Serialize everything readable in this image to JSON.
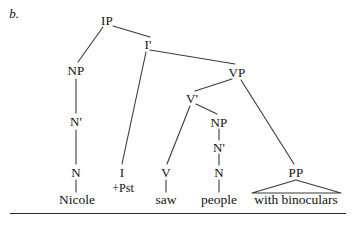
{
  "figure": {
    "item_label": "b.",
    "caption": "",
    "sentence": "Nicole saw people with binoculars"
  },
  "style": {
    "line_color": "#3a3a3a",
    "text_color": "#111111",
    "background": "#ffffff",
    "rule_color": "#2a2a2a"
  },
  "tree": {
    "nodes": [
      {
        "id": "IP",
        "label": "IP",
        "x": 107,
        "y": 20
      },
      {
        "id": "NP1",
        "label": "NP",
        "x": 76,
        "y": 70
      },
      {
        "id": "Nbar1",
        "label": "N'",
        "x": 76,
        "y": 121
      },
      {
        "id": "N1",
        "label": "N",
        "x": 76,
        "y": 172
      },
      {
        "id": "Ibar",
        "label": "I'",
        "x": 148,
        "y": 44
      },
      {
        "id": "I",
        "label": "I",
        "x": 122,
        "y": 172
      },
      {
        "id": "VP",
        "label": "VP",
        "x": 237,
        "y": 72
      },
      {
        "id": "Vbar",
        "label": "V'",
        "x": 192,
        "y": 98
      },
      {
        "id": "V",
        "label": "V",
        "x": 166,
        "y": 172
      },
      {
        "id": "NP2",
        "label": "NP",
        "x": 219,
        "y": 122
      },
      {
        "id": "Nbar2",
        "label": "N'",
        "x": 219,
        "y": 147
      },
      {
        "id": "N2",
        "label": "N",
        "x": 219,
        "y": 172
      },
      {
        "id": "PP",
        "label": "PP",
        "x": 296,
        "y": 172
      }
    ],
    "features": [
      {
        "id": "pst",
        "label": "+Pst",
        "x": 123,
        "y": 188
      }
    ],
    "leaves": [
      {
        "id": "w-nicole",
        "label": "Nicole",
        "x": 77,
        "y": 200
      },
      {
        "id": "w-saw",
        "label": "saw",
        "x": 166,
        "y": 200
      },
      {
        "id": "w-people",
        "label": "people",
        "x": 219,
        "y": 200
      },
      {
        "id": "w-with-bin",
        "label": "with binoculars",
        "x": 296,
        "y": 200
      }
    ],
    "edges": [
      {
        "id": "e-ip-np",
        "from": "IP",
        "to": "NP1",
        "x1": 103,
        "y1": 27,
        "x2": 78,
        "y2": 62
      },
      {
        "id": "e-ip-ibar",
        "from": "IP",
        "to": "Ibar",
        "x1": 113,
        "y1": 26,
        "x2": 150,
        "y2": 37
      },
      {
        "id": "e-np-nbar",
        "from": "NP1",
        "to": "Nbar1",
        "x1": 76,
        "y1": 79,
        "x2": 76,
        "y2": 113
      },
      {
        "id": "e-nbar-n",
        "from": "Nbar1",
        "to": "N1",
        "x1": 76,
        "y1": 130,
        "x2": 76,
        "y2": 164
      },
      {
        "id": "e-n-nicole",
        "from": "N1",
        "to": "w-nicole",
        "x1": 76,
        "y1": 180,
        "x2": 76,
        "y2": 192
      },
      {
        "id": "e-ibar-i",
        "from": "Ibar",
        "to": "I",
        "x1": 146,
        "y1": 52,
        "x2": 122,
        "y2": 164
      },
      {
        "id": "e-ibar-vp",
        "from": "Ibar",
        "to": "VP",
        "x1": 150,
        "y1": 50,
        "x2": 235,
        "y2": 64
      },
      {
        "id": "e-vp-vbar",
        "from": "VP",
        "to": "Vbar",
        "x1": 232,
        "y1": 79,
        "x2": 195,
        "y2": 91
      },
      {
        "id": "e-vp-pp",
        "from": "VP",
        "to": "PP",
        "x1": 241,
        "y1": 80,
        "x2": 294,
        "y2": 164
      },
      {
        "id": "e-vbar-v",
        "from": "Vbar",
        "to": "V",
        "x1": 190,
        "y1": 106,
        "x2": 167,
        "y2": 164
      },
      {
        "id": "e-vbar-np2",
        "from": "Vbar",
        "to": "NP2",
        "x1": 196,
        "y1": 104,
        "x2": 217,
        "y2": 114
      },
      {
        "id": "e-np2-nbar2",
        "from": "NP2",
        "to": "Nbar2",
        "x1": 219,
        "y1": 129,
        "x2": 219,
        "y2": 140
      },
      {
        "id": "e-nbar2-n2",
        "from": "Nbar2",
        "to": "N2",
        "x1": 219,
        "y1": 154,
        "x2": 219,
        "y2": 165
      },
      {
        "id": "e-n2-people",
        "from": "N2",
        "to": "w-people",
        "x1": 219,
        "y1": 180,
        "x2": 219,
        "y2": 192
      },
      {
        "id": "e-v-saw",
        "from": "V",
        "to": "w-saw",
        "x1": 166,
        "y1": 180,
        "x2": 166,
        "y2": 192
      }
    ],
    "triangle": {
      "id": "pp-triangle",
      "apex_x": 296,
      "apex_y": 180,
      "left_x": 252,
      "left_y": 193,
      "right_x": 341,
      "right_y": 193
    }
  }
}
